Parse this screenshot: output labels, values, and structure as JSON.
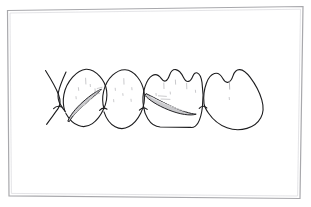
{
  "figure": {
    "kind": "line-art-illustration",
    "title": "Dental illustration: four teeth in buccal view with interproximal tape bands",
    "caption": "",
    "background_color": "#ffffff",
    "frame": {
      "name": "illustration-border",
      "stroke_color": "#a8a8ac",
      "stroke_width": 1.2,
      "corners": [
        [
          7,
          10
        ],
        [
          303,
          6
        ],
        [
          300,
          199
        ],
        [
          9,
          196
        ]
      ]
    },
    "ink": {
      "outline_color": "#1c1c1e",
      "outline_width": 1.1,
      "band_outline_color": "#232326",
      "band_fill_color": "#c9c9cc",
      "stipple_color": "#b9b9bd",
      "faint_line_color": "#9a9a9e"
    },
    "teeth": [
      {
        "index": 0,
        "label": "partial-tooth-left-edge",
        "description": "partially visible tooth at left margin, only distal contour shown",
        "has_band": false
      },
      {
        "index": 1,
        "label": "tooth-premolar-first",
        "description": "premolar with dark tapered tape band crossing the cervical third",
        "has_band": true,
        "band": "band-lower-left"
      },
      {
        "index": 2,
        "label": "tooth-premolar-second",
        "description": "premolar with faint occlusal stipple, no band",
        "has_band": false
      },
      {
        "index": 3,
        "label": "tooth-molar-first",
        "description": "molar with long dark tape band sweeping across the crown",
        "has_band": true,
        "band": "band-lower-right"
      },
      {
        "index": 4,
        "label": "tooth-molar-second",
        "description": "molar at right, two cusps, short central groove, no band",
        "has_band": false
      }
    ],
    "bands": [
      {
        "name": "band-lower-left",
        "description": "tapered crescent band, thick at lower-left, tapering up to the right",
        "fill": "#c9c9cc",
        "stroke": "#232326"
      },
      {
        "name": "band-lower-right",
        "description": "long tapered crescent band, thick at left, tapering to the right",
        "fill": "#c9c9cc",
        "stroke": "#232326"
      }
    ]
  }
}
